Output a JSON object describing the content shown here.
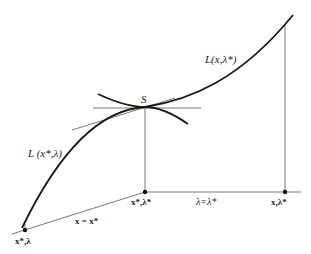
{
  "diagram": {
    "colors": {
      "curve": "#1a1a1a",
      "line": "#555555",
      "text": "#222222",
      "background": "#ffffff"
    },
    "labels": {
      "saddle": "S",
      "curve_x": "L(x,λ*)",
      "curve_lambda": "L (x*,λ)",
      "point_origin": "x*,λ*",
      "point_right": "x,λ*",
      "point_left": "x*,λ",
      "edge_x": "x = x*",
      "edge_lambda": "λ=λ*"
    },
    "points": [
      {
        "name": "S",
        "x": 145,
        "y": 107
      },
      {
        "name": "x*,λ*",
        "x": 145,
        "y": 192
      },
      {
        "name": "x,λ*",
        "x": 285,
        "y": 192
      },
      {
        "name": "x*,λ",
        "x": 25,
        "y": 230
      }
    ]
  }
}
